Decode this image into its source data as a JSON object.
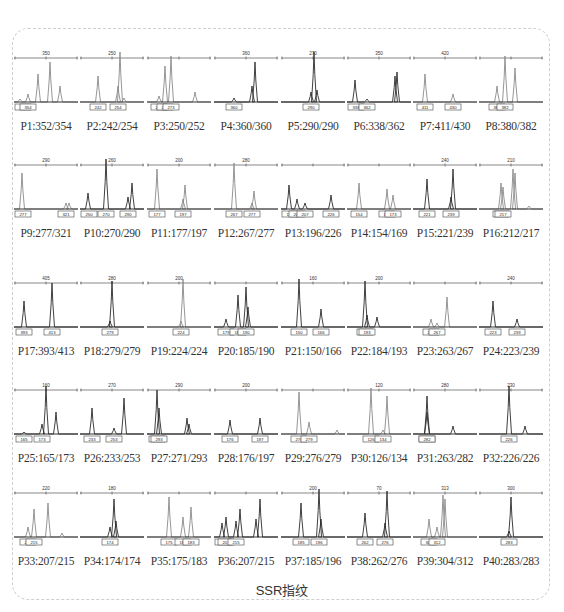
{
  "caption": "SSR指纹",
  "colors": {
    "frame_border": "#cfcfcf",
    "peak_dark": "#222222",
    "peak_gray": "#888888",
    "label_text": "#333333"
  },
  "panels": [
    {
      "id": "P1",
      "label": "P1:352/354",
      "ruler_tick": "350",
      "alleles": [
        "352",
        "354"
      ],
      "tone": "gray"
    },
    {
      "id": "P2",
      "label": "P2:242/254",
      "ruler_tick": "250",
      "alleles": [
        "242",
        "254"
      ],
      "tone": "gray"
    },
    {
      "id": "P3",
      "label": "P3:250/252",
      "ruler_tick": "",
      "alleles": [
        "250",
        "252",
        "273"
      ],
      "tone": "gray"
    },
    {
      "id": "P4",
      "label": "P4:360/360",
      "ruler_tick": "360",
      "alleles": [
        "360"
      ],
      "tone": "dark"
    },
    {
      "id": "P5",
      "label": "P5:290/290",
      "ruler_tick": "270",
      "alleles": [
        "290"
      ],
      "tone": "dark"
    },
    {
      "id": "P6",
      "label": "P6:338/362",
      "ruler_tick": "350",
      "alleles": [
        "338",
        "362"
      ],
      "tone": "dark"
    },
    {
      "id": "P7",
      "label": "P7:411/430",
      "ruler_tick": "420",
      "alleles": [
        "411",
        "430"
      ],
      "tone": "gray"
    },
    {
      "id": "P8",
      "label": "P8:380/382",
      "ruler_tick": "",
      "alleles": [
        "380",
        "382"
      ],
      "tone": "gray"
    },
    {
      "id": "P9",
      "label": "P9:277/321",
      "ruler_tick": "290",
      "alleles": [
        "277",
        "321"
      ],
      "tone": "gray"
    },
    {
      "id": "P10",
      "label": "P10:270/290",
      "ruler_tick": "260",
      "alleles": [
        "250",
        "270",
        "290"
      ],
      "tone": "dark"
    },
    {
      "id": "P11",
      "label": "P11:177/197",
      "ruler_tick": "200",
      "alleles": [
        "177",
        "197"
      ],
      "tone": "gray"
    },
    {
      "id": "P12",
      "label": "P12:267/277",
      "ruler_tick": "280",
      "alleles": [
        "267",
        "277"
      ],
      "tone": "gray"
    },
    {
      "id": "P13",
      "label": "P13:196/226",
      "ruler_tick": "",
      "alleles": [
        "196",
        "206",
        "207",
        "226"
      ],
      "tone": "dark"
    },
    {
      "id": "P14",
      "label": "P14:154/169",
      "ruler_tick": "",
      "alleles": [
        "154",
        "169",
        "173"
      ],
      "tone": "gray"
    },
    {
      "id": "P15",
      "label": "P15:221/239",
      "ruler_tick": "240",
      "alleles": [
        "221",
        "239"
      ],
      "tone": "dark"
    },
    {
      "id": "P16",
      "label": "P16:212/217",
      "ruler_tick": "210",
      "alleles": [
        "212",
        "217"
      ],
      "tone": "gray"
    },
    {
      "id": "P17",
      "label": "P17:393/413",
      "ruler_tick": "405",
      "alleles": [
        "393",
        "413"
      ],
      "tone": "dark"
    },
    {
      "id": "P18",
      "label": "P18:279/279",
      "ruler_tick": "280",
      "alleles": [
        "279"
      ],
      "tone": "dark"
    },
    {
      "id": "P19",
      "label": "P19:224/224",
      "ruler_tick": "200",
      "alleles": [
        "224"
      ],
      "tone": "gray"
    },
    {
      "id": "P20",
      "label": "P20:185/190",
      "ruler_tick": "",
      "alleles": [
        "179",
        "185",
        "190"
      ],
      "tone": "dark"
    },
    {
      "id": "P21",
      "label": "P21:150/166",
      "ruler_tick": "160",
      "alleles": [
        "150",
        "166"
      ],
      "tone": "dark"
    },
    {
      "id": "P22",
      "label": "P22:184/193",
      "ruler_tick": "200",
      "alleles": [
        "184",
        "193"
      ],
      "tone": "dark"
    },
    {
      "id": "P23",
      "label": "P23:263/267",
      "ruler_tick": "",
      "alleles": [
        "263",
        "267"
      ],
      "tone": "gray"
    },
    {
      "id": "P24",
      "label": "P24:223/239",
      "ruler_tick": "240",
      "alleles": [
        "223",
        "239"
      ],
      "tone": "dark"
    },
    {
      "id": "P25",
      "label": "P25:165/173",
      "ruler_tick": "160",
      "alleles": [
        "165",
        "173"
      ],
      "tone": "dark"
    },
    {
      "id": "P26",
      "label": "P26:233/253",
      "ruler_tick": "270",
      "alleles": [
        "233",
        "253"
      ],
      "tone": "dark"
    },
    {
      "id": "P27",
      "label": "P27:271/293",
      "ruler_tick": "290",
      "alleles": [
        "271",
        "293"
      ],
      "tone": "dark"
    },
    {
      "id": "P28",
      "label": "P28:176/197",
      "ruler_tick": "200",
      "alleles": [
        "176",
        "197"
      ],
      "tone": "dark"
    },
    {
      "id": "P29",
      "label": "P29:276/279",
      "ruler_tick": "",
      "alleles": [
        "276",
        "279"
      ],
      "tone": "gray"
    },
    {
      "id": "P30",
      "label": "P30:126/134",
      "ruler_tick": "120",
      "alleles": [
        "126",
        "134"
      ],
      "tone": "gray"
    },
    {
      "id": "P31",
      "label": "P31:263/282",
      "ruler_tick": "280",
      "alleles": [
        "263",
        "282"
      ],
      "tone": "dark"
    },
    {
      "id": "P32",
      "label": "P32:226/226",
      "ruler_tick": "230",
      "alleles": [
        "226"
      ],
      "tone": "dark"
    },
    {
      "id": "P33",
      "label": "P33:207/215",
      "ruler_tick": "220",
      "alleles": [
        "207",
        "215"
      ],
      "tone": "gray"
    },
    {
      "id": "P34",
      "label": "P34:174/174",
      "ruler_tick": "180",
      "alleles": [
        "174"
      ],
      "tone": "dark"
    },
    {
      "id": "P35",
      "label": "P35:175/183",
      "ruler_tick": "",
      "alleles": [
        "175",
        "180",
        "183"
      ],
      "tone": "gray"
    },
    {
      "id": "P36",
      "label": "P36:207/215",
      "ruler_tick": "",
      "alleles": [
        "204",
        "207",
        "215"
      ],
      "tone": "dark"
    },
    {
      "id": "P37",
      "label": "P37:185/196",
      "ruler_tick": "200",
      "alleles": [
        "185",
        "196"
      ],
      "tone": "dark"
    },
    {
      "id": "P38",
      "label": "P38:262/276",
      "ruler_tick": "70",
      "alleles": [
        "262",
        "276"
      ],
      "tone": "dark"
    },
    {
      "id": "P39",
      "label": "P39:304/312",
      "ruler_tick": "313",
      "alleles": [
        "304",
        "312"
      ],
      "tone": "gray"
    },
    {
      "id": "P40",
      "label": "P40:283/283",
      "ruler_tick": "300",
      "alleles": [
        "283"
      ],
      "tone": "dark"
    }
  ]
}
